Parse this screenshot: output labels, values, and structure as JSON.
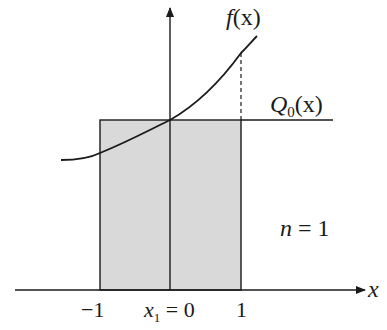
{
  "diagram": {
    "colors": {
      "fill": "#d9d9d9",
      "stroke": "#1a1a1a",
      "background": "#ffffff"
    },
    "labels": {
      "function": "f(x)",
      "function_name": "f",
      "function_arg": "(x)",
      "polynomial_name": "Q",
      "polynomial_sub": "0",
      "polynomial_arg": "(x)",
      "n_label": "n",
      "n_eq": " = 1",
      "x_axis": "x",
      "tick_left": "−1",
      "tick_center_var": "x",
      "tick_center_sub": "1",
      "tick_center_eq": " = 0",
      "tick_right": "1"
    },
    "interval": [
      -1,
      1
    ],
    "node": 0,
    "n": 1
  }
}
